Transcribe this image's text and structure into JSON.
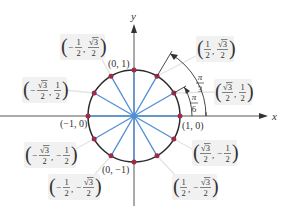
{
  "colors": {
    "circle": "#2b2b2b",
    "radius": "#4f8fd6",
    "point": "#9b2d4a",
    "axis": "#444444",
    "label_bg": "#f1f1f1",
    "leader": "#e3e3e3",
    "text": "#333333"
  },
  "axes": {
    "x_label": "x",
    "y_label": "y"
  },
  "angle_labels": {
    "pi_over_3": {
      "num": "π",
      "den": "3"
    },
    "pi_over_6": {
      "num": "π",
      "den": "6"
    }
  },
  "simple_points": [
    {
      "id": "p0",
      "text": "(1, 0)"
    },
    {
      "id": "p90",
      "text": "(0, 1)"
    },
    {
      "id": "p180",
      "text": "(−1, 0)"
    },
    {
      "id": "p270",
      "text": "(0, −1)"
    }
  ],
  "fraction_points": [
    {
      "id": "p30",
      "x": {
        "sign": "",
        "num": "√3",
        "den": "2"
      },
      "y": {
        "sign": "",
        "num": "1",
        "den": "2"
      }
    },
    {
      "id": "p60",
      "x": {
        "sign": "",
        "num": "1",
        "den": "2"
      },
      "y": {
        "sign": "",
        "num": "√3",
        "den": "2"
      }
    },
    {
      "id": "p120",
      "x": {
        "sign": "−",
        "num": "1",
        "den": "2"
      },
      "y": {
        "sign": "",
        "num": "√3",
        "den": "2"
      }
    },
    {
      "id": "p150",
      "x": {
        "sign": "−",
        "num": "√3",
        "den": "2"
      },
      "y": {
        "sign": "",
        "num": "1",
        "den": "2"
      }
    },
    {
      "id": "p210",
      "x": {
        "sign": "−",
        "num": "√3",
        "den": "2"
      },
      "y": {
        "sign": "−",
        "num": "1",
        "den": "2"
      }
    },
    {
      "id": "p240",
      "x": {
        "sign": "−",
        "num": "1",
        "den": "2"
      },
      "y": {
        "sign": "−",
        "num": "√3",
        "den": "2"
      }
    },
    {
      "id": "p300",
      "x": {
        "sign": "",
        "num": "1",
        "den": "2"
      },
      "y": {
        "sign": "−",
        "num": "√3",
        "den": "2"
      }
    },
    {
      "id": "p330",
      "x": {
        "sign": "",
        "num": "√3",
        "den": "2"
      },
      "y": {
        "sign": "−",
        "num": "1",
        "den": "2"
      }
    }
  ]
}
